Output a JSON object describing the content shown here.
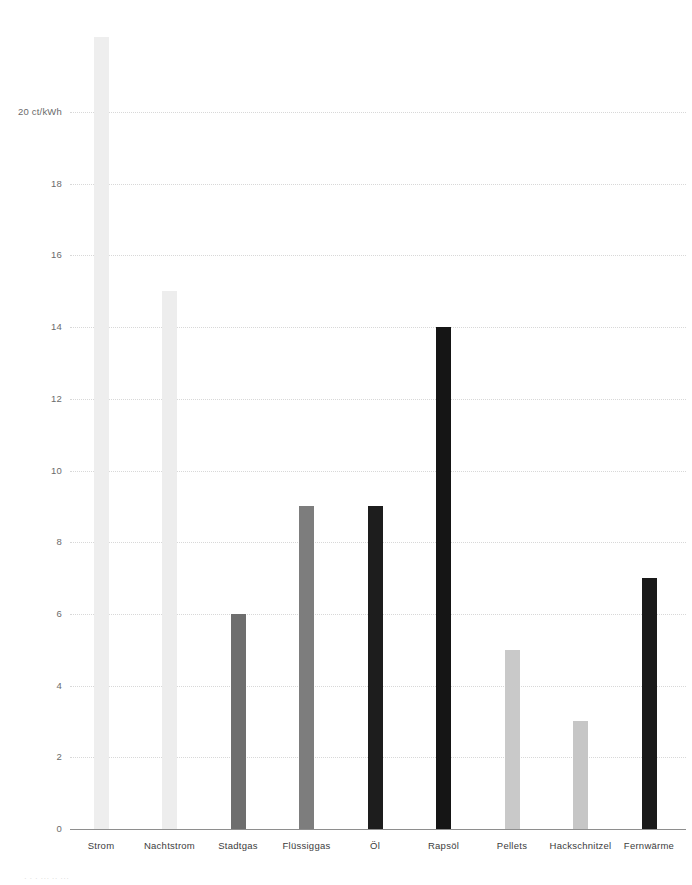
{
  "chart_data": {
    "type": "bar",
    "title": "",
    "subtitle": "",
    "xlabel": "",
    "ylabel": "ct/kWh",
    "axis_unit_label": "20 ct/kWh",
    "categories": [
      "Strom",
      "Nachtstrom",
      "Stadtgas",
      "Flüssiggas",
      "Öl",
      "Rapsöl",
      "Pellets",
      "Hackschnitzel",
      "Fernwärme"
    ],
    "values": [
      22.1,
      15,
      6,
      9,
      9,
      14,
      5,
      3,
      7
    ],
    "bar_colors": [
      "#eeeeee",
      "#ededed",
      "#6e6e6e",
      "#7d7d7d",
      "#1d1d1d",
      "#151515",
      "#c9c9c9",
      "#c6c6c6",
      "#1a1a1a"
    ],
    "ylim": [
      0,
      20
    ],
    "y_ticks": [
      0,
      2,
      4,
      6,
      8,
      10,
      12,
      14,
      16,
      18,
      20
    ],
    "y_tick_labels": [
      "0",
      "2",
      "4",
      "6",
      "8",
      "10",
      "12",
      "14",
      "16",
      "18",
      "20 ct/kWh"
    ],
    "grid": true,
    "grid_style": "dotted",
    "grid_color": "#d8d8d8",
    "legend": "none",
    "baseline_color": "#8e8e8e",
    "background": "#ffffff",
    "note": "Balken Strom überschreitet die oberste Gitterlinie"
  },
  "footnote": {
    "text": "· · · ···  ··  ···"
  }
}
